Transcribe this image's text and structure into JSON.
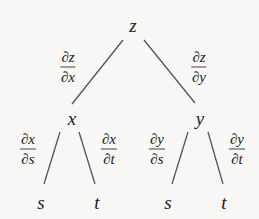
{
  "diagram": {
    "type": "tree-diagram",
    "line_color": "#555555",
    "nodes": [
      {
        "id": "z",
        "label": "z",
        "x": 133,
        "y": 25
      },
      {
        "id": "x",
        "label": "x",
        "x": 72,
        "y": 118
      },
      {
        "id": "y",
        "label": "y",
        "x": 200,
        "y": 118
      },
      {
        "id": "xs",
        "label": "s",
        "x": 41,
        "y": 202
      },
      {
        "id": "xt",
        "label": "t",
        "x": 97,
        "y": 202
      },
      {
        "id": "ys",
        "label": "s",
        "x": 168,
        "y": 202
      },
      {
        "id": "yt",
        "label": "t",
        "x": 224,
        "y": 202
      }
    ],
    "edges": [
      {
        "from": "z",
        "to": "x",
        "x1": 123,
        "y1": 40,
        "x2": 72,
        "y2": 104,
        "label_num": "∂z",
        "label_den": "∂x",
        "lx": 68,
        "ly": 67
      },
      {
        "from": "z",
        "to": "y",
        "x1": 144,
        "y1": 40,
        "x2": 195,
        "y2": 103,
        "label_num": "∂z",
        "label_den": "∂y",
        "lx": 199,
        "ly": 67
      },
      {
        "from": "x",
        "to": "s",
        "x1": 60,
        "y1": 132,
        "x2": 44,
        "y2": 184,
        "label_num": "∂x",
        "label_den": "∂s",
        "lx": 28,
        "ly": 149
      },
      {
        "from": "x",
        "to": "t",
        "x1": 79,
        "y1": 132,
        "x2": 95,
        "y2": 184,
        "label_num": "∂x",
        "label_den": "∂t",
        "lx": 109,
        "ly": 149
      },
      {
        "from": "y",
        "to": "s",
        "x1": 188,
        "y1": 132,
        "x2": 172,
        "y2": 184,
        "label_num": "∂y",
        "label_den": "∂s",
        "lx": 157,
        "ly": 149
      },
      {
        "from": "y",
        "to": "t",
        "x1": 208,
        "y1": 132,
        "x2": 223,
        "y2": 184,
        "label_num": "∂y",
        "label_den": "∂t",
        "lx": 237,
        "ly": 149
      }
    ]
  }
}
